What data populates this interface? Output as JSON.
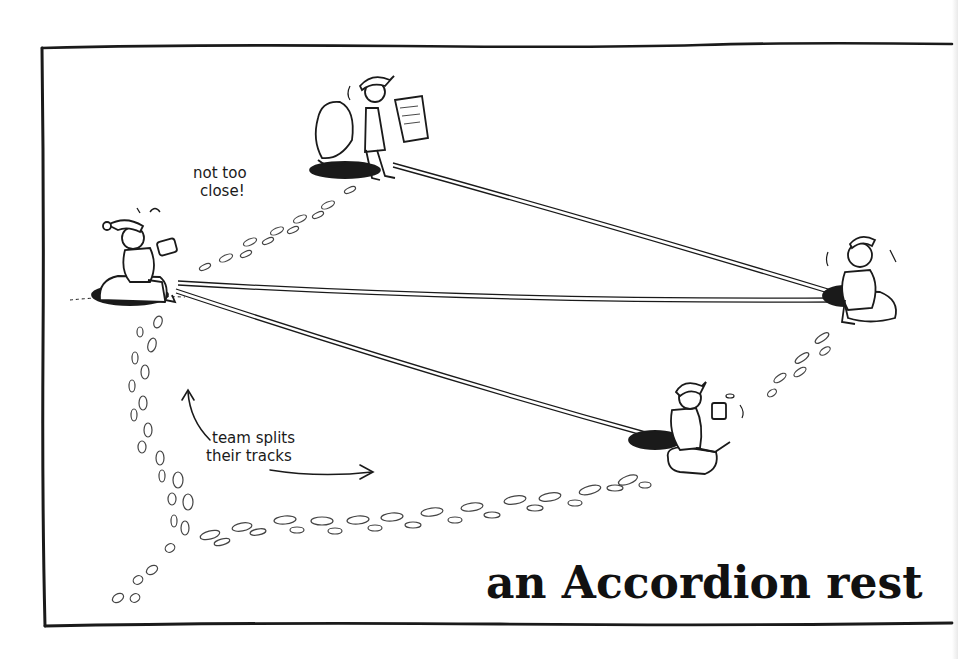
{
  "illustration": {
    "title": "an Accordion rest",
    "annotations": {
      "not_too_close_line1": "not too",
      "not_too_close_line2": "close!",
      "team_splits_line1": "team splits",
      "team_splits_line2": "their tracks"
    },
    "figures": [
      {
        "id": "climber-left",
        "description": "climber in beanie sitting on pack, eating sandwich"
      },
      {
        "id": "climber-top",
        "description": "climber in cap standing, reading map, pack beside"
      },
      {
        "id": "climber-right",
        "description": "climber in hat sitting on pack"
      },
      {
        "id": "climber-bottom",
        "description": "climber in cap sitting on pack, holding mug"
      }
    ],
    "colors": {
      "ink": "#1a1a1a",
      "background": "#ffffff",
      "footprints": "#444444"
    }
  }
}
